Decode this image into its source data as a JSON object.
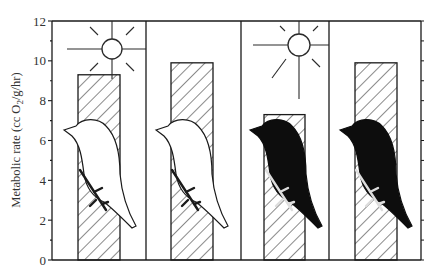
{
  "chart_data": {
    "type": "bar",
    "title": "",
    "xlabel": "",
    "ylabel": "Metabolic rate (cc O2/g/hr)",
    "ylabel_parts": {
      "pre": "Metabolic rate (cc O",
      "sub": "2",
      "post": "/g/hr)"
    },
    "ylim": [
      0,
      12
    ],
    "yticks_major": [
      0,
      2,
      4,
      6,
      8,
      10,
      12
    ],
    "yticks_minor_step": 1,
    "grid": false,
    "legend": null,
    "categories": [
      "White bird, sun",
      "White bird, no sun",
      "Black bird, sun",
      "Black bird, no sun"
    ],
    "values": [
      9.3,
      9.9,
      7.3,
      9.9
    ],
    "bar_fill": "diagonal-hatch",
    "panels": [
      {
        "bird": "white",
        "sun": true
      },
      {
        "bird": "white",
        "sun": false
      },
      {
        "bird": "black",
        "sun": true
      },
      {
        "bird": "black",
        "sun": false
      }
    ],
    "right_axis": {
      "ticks": true,
      "labels": false
    }
  },
  "colors": {
    "ink": "#1a1a1a",
    "label": "#333333",
    "background": "#ffffff",
    "white_bird": "#ffffff",
    "black_bird": "#0d0d0d"
  }
}
